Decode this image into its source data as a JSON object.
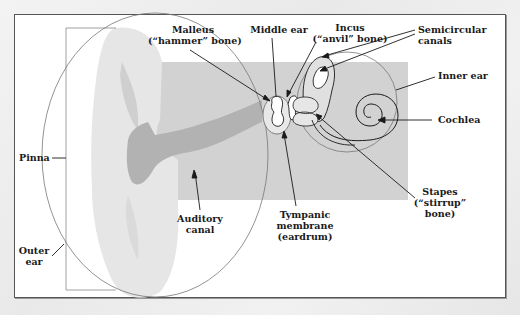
{
  "diagram": {
    "colors": {
      "frame_border": "#555555",
      "frame_fill": "#ffffff",
      "pinna_fill": "#e6e6e6",
      "canal_fill": "#b0b0b0",
      "inner_region_fill": "#cfcfcf",
      "outline": "#1a1a1a",
      "circle_stroke": "#777777",
      "text": "#1a1a1a"
    },
    "labels": {
      "malleus": {
        "line1": "Malleus",
        "line2": "(“hammer” bone)"
      },
      "middle_ear": {
        "line1": "Middle ear"
      },
      "incus": {
        "line1": "Incus",
        "line2": "(“anvil” bone)"
      },
      "semicircular_canals": {
        "line1": "Semicircular",
        "line2": "canals"
      },
      "inner_ear": {
        "line1": "Inner ear"
      },
      "cochlea": {
        "line1": "Cochlea"
      },
      "stapes": {
        "line1": "Stapes",
        "line2": "(“stirrup”",
        "line3": "bone)"
      },
      "tympanic_membrane": {
        "line1": "Tympanic",
        "line2": "membrane",
        "line3": "(eardrum)"
      },
      "auditory_canal": {
        "line1": "Auditory",
        "line2": "canal"
      },
      "pinna": {
        "line1": "Pinna"
      },
      "outer_ear": {
        "line1": "Outer",
        "line2": "ear"
      }
    }
  }
}
